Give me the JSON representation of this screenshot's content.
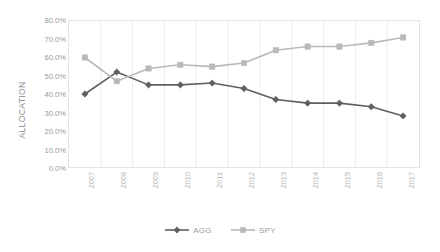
{
  "chart": {
    "y_axis_title": "ALLOCATION",
    "y_ticks": [
      "80.0%",
      "70.0%",
      "60.0%",
      "50.0%",
      "40.0%",
      "30.0%",
      "20.0%",
      "10.0%",
      "0.0%"
    ],
    "legend_position": "bottom",
    "colors": {
      "agg": "#5f5f5f",
      "spy": "#b9b9b9",
      "grid": "#ececec",
      "axis_text": "#9a9a9a",
      "plot_border": "#e4e4e4",
      "background": "#ffffff"
    }
  },
  "legend": {
    "items": [
      {
        "label": "AGG",
        "color": "#5f5f5f",
        "marker": "diamond"
      },
      {
        "label": "SPY",
        "color": "#b9b9b9",
        "marker": "square"
      }
    ]
  },
  "chart_data": {
    "type": "line",
    "title": "",
    "xlabel": "",
    "ylabel": "ALLOCATION",
    "ylim": [
      0,
      80
    ],
    "ytick_values": [
      80,
      70,
      60,
      50,
      40,
      30,
      20,
      10,
      0
    ],
    "ytick_labels": [
      "80.0%",
      "70.0%",
      "60.0%",
      "50.0%",
      "40.0%",
      "30.0%",
      "20.0%",
      "10.0%",
      "0.0%"
    ],
    "grid": true,
    "grid_axis": "x",
    "legend_position": "bottom",
    "categories": [
      "2007",
      "2008",
      "2009",
      "2010",
      "2011",
      "2012",
      "2013",
      "2014",
      "2015",
      "2016",
      "2017"
    ],
    "series": [
      {
        "name": "AGG",
        "color": "#5f5f5f",
        "marker": "diamond",
        "values": [
          40.0,
          52.0,
          45.0,
          45.0,
          46.0,
          43.0,
          37.0,
          35.0,
          35.0,
          33.0,
          28.0
        ]
      },
      {
        "name": "SPY",
        "color": "#b9b9b9",
        "marker": "square",
        "values": [
          60.0,
          47.0,
          54.0,
          56.0,
          55.0,
          57.0,
          64.0,
          66.0,
          66.0,
          68.0,
          71.0
        ]
      }
    ]
  }
}
